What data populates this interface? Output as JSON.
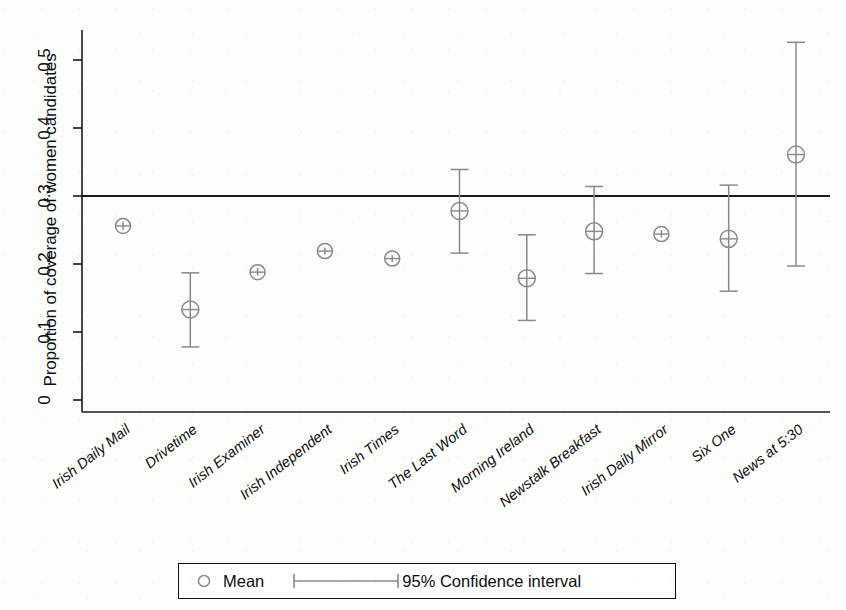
{
  "chart_data": {
    "type": "scatter",
    "title": "",
    "subtitle": "",
    "xlabel": "",
    "ylabel": "Proportion of coverage of women candidates",
    "ylim": [
      0,
      0.55
    ],
    "yticks": [
      0,
      0.1,
      0.2,
      0.3,
      0.4,
      0.5
    ],
    "ytick_labels": [
      "0",
      "0.1",
      "0.2",
      "0.3",
      "0.4",
      "0.5"
    ],
    "grid": false,
    "legend_position": "bottom",
    "reference_line": {
      "value": 0.3,
      "label": ""
    },
    "categories": [
      "Irish Daily Mail",
      "Drivetime",
      "Irish Examiner",
      "Irish Independent",
      "Irish Times",
      "The Last Word",
      "Morning Ireland",
      "Newstalk Breakfast",
      "Irish Daily Mirror",
      "Six One",
      "News at 5:30"
    ],
    "series": [
      {
        "name": "Mean",
        "values": [
          0.256,
          0.133,
          0.188,
          0.219,
          0.208,
          0.278,
          0.179,
          0.248,
          0.244,
          0.237,
          0.361
        ]
      },
      {
        "name": "95% Confidence interval lower",
        "values": [
          0.25,
          0.078,
          0.183,
          0.214,
          0.203,
          0.216,
          0.117,
          0.186,
          0.239,
          0.16,
          0.197
        ]
      },
      {
        "name": "95% Confidence interval upper",
        "values": [
          0.262,
          0.187,
          0.194,
          0.224,
          0.213,
          0.339,
          0.243,
          0.314,
          0.25,
          0.316,
          0.526
        ]
      }
    ],
    "legend": [
      {
        "marker": "circle",
        "label": "Mean"
      },
      {
        "marker": "capped-line",
        "label": "95% Confidence interval"
      }
    ],
    "colors": {
      "marker": "#8a8a8a",
      "error_bar": "#8a8a8a",
      "axis": "#1a1a1a",
      "reference_line": "#1a1a1a",
      "background": "#fdfdfc"
    }
  }
}
